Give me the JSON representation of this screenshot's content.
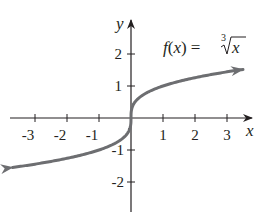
{
  "chart_data": {
    "type": "line",
    "title": "",
    "function_label": {
      "lhs": "f(x) = ",
      "radicand": "x",
      "root_index": "3"
    },
    "xlabel": "x",
    "ylabel": "y",
    "x_ticks": [
      "-3",
      "-2",
      "-1",
      "1",
      "2",
      "3"
    ],
    "y_ticks": [
      "2",
      "1",
      "-1",
      "-2"
    ],
    "xlim": [
      -3.8,
      3.7
    ],
    "ylim": [
      -2.9,
      3.1
    ],
    "grid": false,
    "legend": null,
    "series": [
      {
        "name": "f(x) = cube root of x",
        "x": [
          -3.7,
          -3,
          -2,
          -1,
          -0.5,
          -0.125,
          0,
          0.125,
          0.5,
          1,
          2,
          3,
          3.5
        ],
        "y": [
          -1.55,
          -1.44,
          -1.26,
          -1.0,
          -0.79,
          -0.5,
          0,
          0.5,
          0.79,
          1.0,
          1.26,
          1.44,
          1.52
        ],
        "arrows": "both",
        "color": "#6d6e71"
      }
    ]
  },
  "colors": {
    "axis": "#231f20",
    "curve": "#6d6e71"
  }
}
